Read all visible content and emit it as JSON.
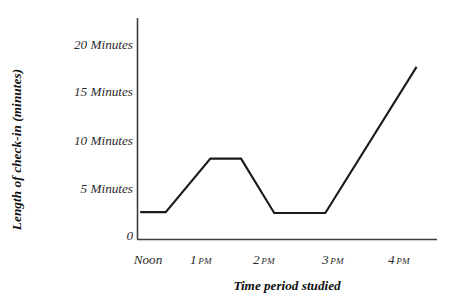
{
  "chart_data": {
    "type": "line",
    "title": "",
    "xlabel": "Time period studied",
    "ylabel": "Length of check-in (minutes)",
    "x": [
      "Noon",
      "1 PM",
      "2 PM",
      "3 PM",
      "4 PM"
    ],
    "x_tick_labels": [
      {
        "value": "Noon",
        "ampm": ""
      },
      {
        "value": "1",
        "ampm": "PM"
      },
      {
        "value": "2",
        "ampm": "PM"
      },
      {
        "value": "3",
        "ampm": "PM"
      },
      {
        "value": "4",
        "ampm": "PM"
      }
    ],
    "y_tick_labels": [
      "20 Minutes",
      "15 Minutes",
      "10 Minutes",
      "5 Minutes",
      "0"
    ],
    "y_tick_values": [
      20,
      15,
      10,
      5,
      0
    ],
    "ylim": [
      0,
      22.5
    ],
    "xlim": [
      11.7,
      16.4
    ],
    "grid": false,
    "legend": false,
    "series": [
      {
        "name": "Length of check-in",
        "color": "#1a1a1a",
        "points": [
          {
            "time": "Noon",
            "hour": 11.75,
            "minutes": 2.4
          },
          {
            "time": "12:15 PM",
            "hour": 12.15,
            "minutes": 2.4
          },
          {
            "time": "1:05 PM",
            "hour": 12.85,
            "minutes": 8.0
          },
          {
            "time": "1:30 PM",
            "hour": 13.33,
            "minutes": 8.0
          },
          {
            "time": "2:05 PM",
            "hour": 13.85,
            "minutes": 2.3
          },
          {
            "time": "2:45 PM",
            "hour": 14.65,
            "minutes": 2.3
          },
          {
            "time": "4:15 PM",
            "hour": 16.08,
            "minutes": 17.6
          }
        ]
      }
    ],
    "axis_color": "#3d3d3d",
    "line_color": "#1a1a1a",
    "background": "#ffffff"
  }
}
